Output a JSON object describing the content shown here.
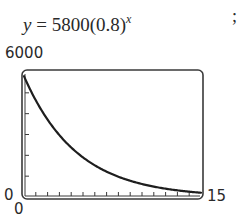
{
  "header": {
    "equation_lhs": "y",
    "equation_eq": " = 5800(0.8)",
    "equation_exp": "x",
    "trailing_punct": ";"
  },
  "axes": {
    "y_max_label": "6000",
    "y_min_label": "0",
    "x_min_label": "0",
    "x_max_label": "15"
  },
  "colors": {
    "curve": "#1e1e1e",
    "frame": "#3a3a3a",
    "text": "#2a2a2a"
  },
  "chart_data": {
    "type": "line",
    "xlabel": "",
    "ylabel": "",
    "xlim": [
      0,
      15
    ],
    "ylim": [
      0,
      6000
    ],
    "x_ticks": [
      0,
      1,
      2,
      3,
      4,
      5,
      6,
      7,
      8,
      9,
      10,
      11,
      12,
      13,
      14,
      15
    ],
    "y_ticks": [
      0,
      1000,
      2000,
      3000,
      4000,
      5000,
      6000
    ],
    "tick_labels": {
      "x": [
        "0",
        "15"
      ],
      "y": [
        "0",
        "6000"
      ]
    },
    "grid": false,
    "legend": null,
    "series": [
      {
        "name": "y = 5800(0.8)^x",
        "x": [
          0,
          1,
          2,
          3,
          4,
          5,
          6,
          7,
          8,
          9,
          10,
          11,
          12,
          13,
          14,
          15
        ],
        "values": [
          5800,
          4640,
          3712,
          2970,
          2376,
          1901,
          1521,
          1216,
          973,
          778,
          623,
          498,
          399,
          319,
          255,
          204
        ]
      }
    ]
  }
}
